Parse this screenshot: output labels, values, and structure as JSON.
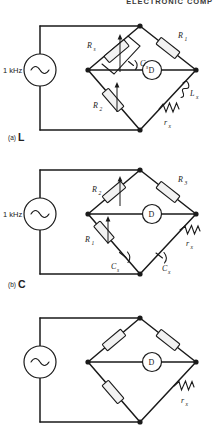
{
  "page": {
    "running_head": "ELECTRONIC COMP",
    "background_color": "#ffffff",
    "ink_color": "#1a1a1a",
    "component_fill": "#f2f2f2"
  },
  "figures": [
    {
      "id": "fig-a",
      "caption_tag": "(a)",
      "caption_body": "L",
      "type": "ac-bridge",
      "source": {
        "label": "1 kHz",
        "symbol": "sine-wave"
      },
      "detector": {
        "label": "D"
      },
      "arms": [
        {
          "position": "upper-left",
          "components": [
            {
              "name": "Rs",
              "label": "R",
              "sub": "s",
              "kind": "variable-resistor"
            },
            {
              "name": "Cs",
              "label": "C",
              "sub": "s",
              "kind": "capacitor"
            }
          ],
          "topology": "parallel"
        },
        {
          "position": "upper-right",
          "components": [
            {
              "name": "R1",
              "label": "R",
              "sub": "1",
              "kind": "resistor"
            }
          ],
          "topology": "series"
        },
        {
          "position": "lower-left",
          "components": [
            {
              "name": "R2",
              "label": "R",
              "sub": "2",
              "kind": "variable-resistor"
            }
          ],
          "topology": "series"
        },
        {
          "position": "lower-right",
          "components": [
            {
              "name": "Lx",
              "label": "L",
              "sub": "x",
              "kind": "inductor"
            },
            {
              "name": "rx",
              "label": "r",
              "sub": "x",
              "kind": "resistor-zigzag"
            }
          ],
          "topology": "series"
        }
      ]
    },
    {
      "id": "fig-b",
      "caption_tag": "(b)",
      "caption_body": "C",
      "type": "ac-bridge",
      "source": {
        "label": "1 kHz",
        "symbol": "sine-wave"
      },
      "detector": {
        "label": "D"
      },
      "arms": [
        {
          "position": "upper-left",
          "components": [
            {
              "name": "R2",
              "label": "R",
              "sub": "2",
              "kind": "variable-resistor"
            }
          ],
          "topology": "series"
        },
        {
          "position": "upper-right",
          "components": [
            {
              "name": "R3",
              "label": "R",
              "sub": "3",
              "kind": "resistor"
            }
          ],
          "topology": "series"
        },
        {
          "position": "lower-left",
          "components": [
            {
              "name": "R1",
              "label": "R",
              "sub": "1",
              "kind": "variable-resistor"
            },
            {
              "name": "Cs",
              "label": "C",
              "sub": "s",
              "kind": "capacitor"
            }
          ],
          "topology": "series"
        },
        {
          "position": "lower-right",
          "components": [
            {
              "name": "rx",
              "label": "r",
              "sub": "x",
              "kind": "resistor-zigzag"
            },
            {
              "name": "Cx",
              "label": "C",
              "sub": "x",
              "kind": "capacitor"
            }
          ],
          "topology": "series"
        }
      ]
    },
    {
      "id": "fig-c",
      "caption_tag": "",
      "caption_body": "",
      "type": "ac-bridge",
      "source": {
        "label": "",
        "symbol": "sine-wave"
      },
      "detector": {
        "label": "D"
      },
      "arms": [
        {
          "position": "upper-left",
          "components": [
            {
              "name": "r-ul",
              "label": "",
              "sub": "",
              "kind": "resistor"
            }
          ],
          "topology": "series"
        },
        {
          "position": "upper-right",
          "components": [
            {
              "name": "r-ur",
              "label": "",
              "sub": "",
              "kind": "resistor"
            }
          ],
          "topology": "series"
        },
        {
          "position": "lower-left",
          "components": [
            {
              "name": "r-ll",
              "label": "",
              "sub": "",
              "kind": "resistor"
            }
          ],
          "topology": "series"
        },
        {
          "position": "lower-right",
          "components": [
            {
              "name": "rx",
              "label": "r",
              "sub": "x",
              "kind": "resistor-zigzag"
            }
          ],
          "topology": "series"
        }
      ]
    }
  ]
}
